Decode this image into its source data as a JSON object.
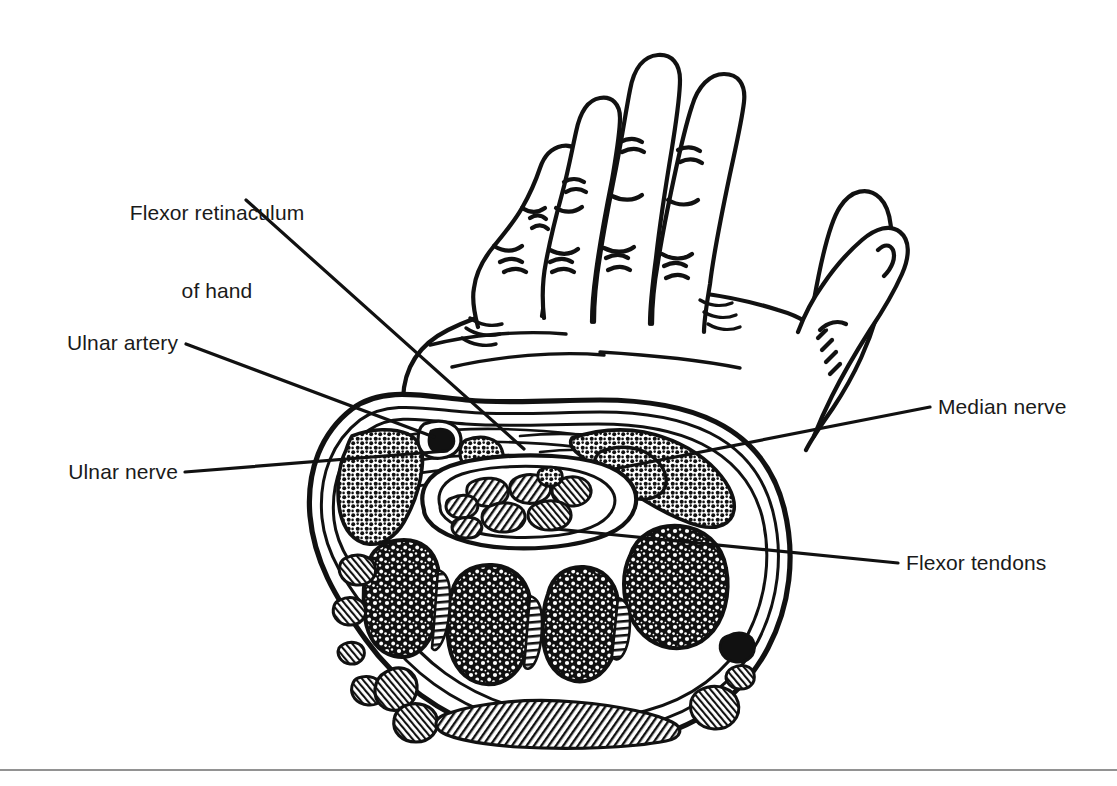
{
  "figure": {
    "type": "anatomical-line-drawing",
    "background_color": "#ffffff",
    "ink_color": "#111111",
    "rule_color": "#6e6e6e"
  },
  "labels": {
    "flexor_retinaculum": {
      "line1": "Flexor retinaculum",
      "line2": "of hand"
    },
    "ulnar_artery": "Ulnar artery",
    "ulnar_nerve": "Ulnar nerve",
    "median_nerve": "Median nerve",
    "flexor_tendons": "Flexor tendons"
  },
  "structures": {
    "hand": "palm-facing hand with four fingers and thumb",
    "cross_section": "transverse section through the wrist",
    "carpal_tunnel_contents": "flexor tendon bundle",
    "hypothenar_fat": "stippled hypothenar soft tissue",
    "thenar_fat": "stippled thenar soft tissue",
    "carpal_bones": "mottled carpal bone cross-sections",
    "extensor_tendons": "hatched dorsal extensor tendons"
  },
  "leader_lines": [
    {
      "name": "flexor-retinaculum-leader",
      "from": [
        246,
        200
      ],
      "to": [
        524,
        449
      ]
    },
    {
      "name": "ulnar-artery-leader",
      "from": [
        186,
        344
      ],
      "to": [
        434,
        437
      ]
    },
    {
      "name": "ulnar-nerve-leader",
      "from": [
        185,
        472
      ],
      "to": [
        447,
        451
      ]
    },
    {
      "name": "median-nerve-leader",
      "from": [
        930,
        407
      ],
      "to": [
        614,
        469
      ]
    },
    {
      "name": "flexor-tendons-leader",
      "from": [
        898,
        563
      ],
      "to": [
        556,
        529
      ]
    }
  ]
}
